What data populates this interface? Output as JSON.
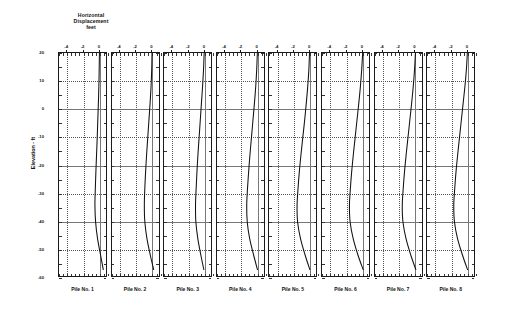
{
  "figure": {
    "title_lines": [
      "Horizontal",
      "Displacement",
      "feet"
    ],
    "ylabel": "Elevation - ft",
    "line_color": "#111111",
    "frame_color": "#1a1a1a",
    "grid_color": "#555555",
    "background": "#ffffff"
  },
  "chart_data": {
    "type": "line",
    "title": "Horizontal Displacement feet",
    "xlabel": "Horizontal Displacement feet",
    "ylabel": "Elevation - ft",
    "xlim": [
      -5,
      1
    ],
    "ylim": [
      -60,
      20
    ],
    "xticks": [
      -4,
      -2,
      0
    ],
    "xticklabels": [
      "-4",
      "-2",
      "0"
    ],
    "yticks": [
      20,
      10,
      0,
      -10,
      -20,
      -30,
      -40,
      -50,
      -60
    ],
    "yticklabels": [
      "20",
      "10",
      "0",
      "-10",
      "-20",
      "-30",
      "-40",
      "-50",
      "-60"
    ],
    "grid": true,
    "legend": "none",
    "shared_y": true,
    "panel_count": 8,
    "series": [
      {
        "name": "Pile No. 1",
        "label": "Pile No. 1",
        "x": [
          -0.05,
          -0.08,
          -0.12,
          -0.18,
          -0.25,
          -0.32,
          -0.4,
          -0.48,
          -0.55,
          -0.6,
          -0.52,
          -0.28,
          0.1,
          0.42
        ],
        "y": [
          20,
          14,
          8,
          2,
          -4,
          -10,
          -16,
          -22,
          -28,
          -34,
          -40,
          -46,
          -52,
          -57
        ]
      },
      {
        "name": "Pile No. 2",
        "label": "Pile No. 2",
        "x": [
          -0.1,
          -0.14,
          -0.22,
          -0.34,
          -0.48,
          -0.62,
          -0.76,
          -0.88,
          -0.98,
          -1.04,
          -0.98,
          -0.72,
          -0.3,
          0.1
        ],
        "y": [
          20,
          14,
          8,
          2,
          -4,
          -10,
          -16,
          -22,
          -28,
          -34,
          -40,
          -46,
          -52,
          -57
        ]
      },
      {
        "name": "Pile No. 3",
        "label": "Pile No. 3",
        "x": [
          -0.08,
          -0.16,
          -0.28,
          -0.42,
          -0.56,
          -0.7,
          -0.84,
          -0.96,
          -1.06,
          -1.14,
          -1.1,
          -0.86,
          -0.48,
          -0.12
        ],
        "y": [
          20,
          14,
          8,
          2,
          -4,
          -10,
          -16,
          -22,
          -28,
          -34,
          -40,
          -46,
          -52,
          -57
        ]
      },
      {
        "name": "Pile No. 4",
        "label": "Pile No. 4",
        "x": [
          -0.06,
          -0.14,
          -0.26,
          -0.42,
          -0.6,
          -0.78,
          -0.96,
          -1.12,
          -1.26,
          -1.36,
          -1.3,
          -1.0,
          -0.5,
          -0.05
        ],
        "y": [
          20,
          14,
          8,
          2,
          -4,
          -10,
          -16,
          -22,
          -28,
          -34,
          -40,
          -46,
          -52,
          -57
        ]
      },
      {
        "name": "Pile No. 5",
        "label": "Pile No. 5",
        "x": [
          -0.04,
          -0.12,
          -0.26,
          -0.44,
          -0.64,
          -0.86,
          -1.08,
          -1.28,
          -1.44,
          -1.56,
          -1.5,
          -1.14,
          -0.56,
          0.0
        ],
        "y": [
          20,
          14,
          8,
          2,
          -4,
          -10,
          -16,
          -22,
          -28,
          -34,
          -40,
          -46,
          -52,
          -57
        ]
      },
      {
        "name": "Pile No. 6",
        "label": "Pile No. 6",
        "x": [
          -0.02,
          -0.14,
          -0.3,
          -0.5,
          -0.72,
          -0.94,
          -1.16,
          -1.36,
          -1.52,
          -1.64,
          -1.56,
          -1.18,
          -0.58,
          0.04
        ],
        "y": [
          20,
          14,
          8,
          2,
          -4,
          -10,
          -16,
          -22,
          -28,
          -34,
          -40,
          -46,
          -52,
          -57
        ]
      },
      {
        "name": "Pile No. 7",
        "label": "Pile No. 7",
        "x": [
          -0.05,
          -0.16,
          -0.32,
          -0.52,
          -0.74,
          -0.96,
          -1.18,
          -1.38,
          -1.54,
          -1.66,
          -1.58,
          -1.2,
          -0.6,
          0.0
        ],
        "y": [
          20,
          14,
          8,
          2,
          -4,
          -10,
          -16,
          -22,
          -28,
          -34,
          -40,
          -46,
          -52,
          -57
        ]
      },
      {
        "name": "Pile No. 8",
        "label": "Pile No. 8",
        "x": [
          -0.06,
          -0.18,
          -0.36,
          -0.58,
          -0.8,
          -1.02,
          -1.24,
          -1.44,
          -1.6,
          -1.72,
          -1.64,
          -1.26,
          -0.64,
          -0.04
        ],
        "y": [
          20,
          14,
          8,
          2,
          -4,
          -10,
          -16,
          -22,
          -28,
          -34,
          -40,
          -46,
          -52,
          -57
        ]
      }
    ]
  }
}
